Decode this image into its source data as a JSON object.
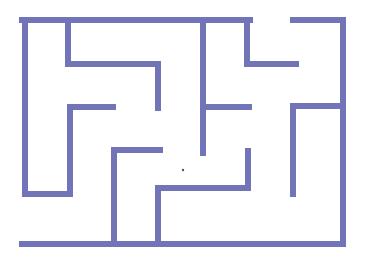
{
  "maze": {
    "background": "#ffffff",
    "wall_color": "#7274b8",
    "wall_width": 6,
    "dot": {
      "x": 183,
      "y": 170,
      "r": 1.2,
      "color": "#555555"
    },
    "walls": [
      {
        "id": "top-left",
        "points": "22,20 250,20"
      },
      {
        "id": "top-right",
        "points": "293,20 343,20 343,244"
      },
      {
        "id": "bottom",
        "points": "22,244 343,244"
      },
      {
        "id": "left",
        "points": "25,20 25,194 70,194 70,107 113,107"
      },
      {
        "id": "upper-left-hook",
        "points": "68,20 68,64 158,64 158,108"
      },
      {
        "id": "upper-right-hook",
        "points": "247,20 247,64 296,64"
      },
      {
        "id": "center-vertical",
        "points": "203,20 203,153"
      },
      {
        "id": "center-branch",
        "points": "203,107 249,107"
      },
      {
        "id": "right-inner",
        "points": "343,106 293,106 293,194"
      },
      {
        "id": "lower-left-L",
        "points": "160,150 114,150 114,244"
      },
      {
        "id": "lower-center-U",
        "points": "158,244 158,188 248,188 248,151"
      }
    ]
  }
}
